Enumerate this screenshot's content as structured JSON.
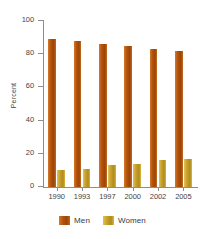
{
  "chart_data": {
    "type": "bar",
    "title": "",
    "subtitle": "",
    "xlabel": "",
    "ylabel": "Percent",
    "categories": [
      "1990",
      "1993",
      "1997",
      "2000",
      "2002",
      "2005"
    ],
    "series": [
      {
        "name": "Men",
        "color": "#B0540C",
        "values": [
          89,
          88,
          86,
          85,
          83,
          82
        ]
      },
      {
        "name": "Women",
        "color": "#C8A030",
        "values": [
          10,
          11,
          13,
          14,
          16,
          17
        ]
      }
    ],
    "ylim": [
      0,
      100
    ],
    "yticks": [
      "0",
      "20",
      "40",
      "60",
      "80",
      "100"
    ],
    "ytick_values": [
      0,
      20,
      40,
      60,
      80,
      100
    ],
    "grid": false,
    "legend_position": "bottom-center"
  }
}
